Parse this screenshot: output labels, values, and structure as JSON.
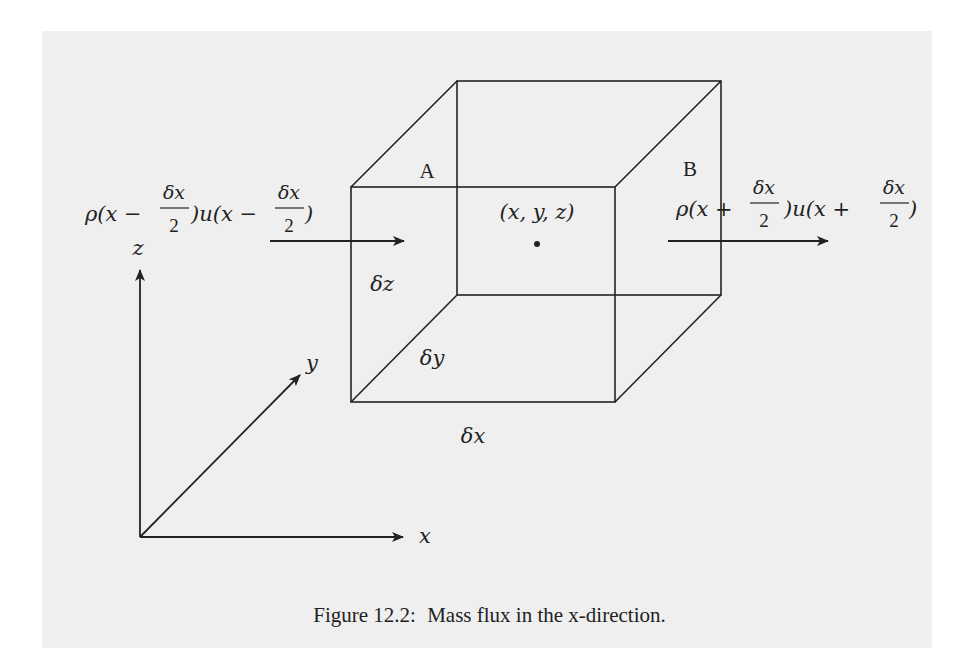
{
  "figure": {
    "caption_prefix": "Figure 12.2:",
    "caption_text": "Mass flux in the x-direction."
  },
  "labels": {
    "face_a": "A",
    "face_b": "B",
    "center_point": "(x, y, z)",
    "delta_x": "δx",
    "delta_y": "δy",
    "delta_z": "δz",
    "axis_x": "x",
    "axis_y": "y",
    "axis_z": "z"
  },
  "inflow": {
    "rho_part": "ρ(x −",
    "frac_num": "δx",
    "frac_den": "2",
    "u_part": ")u(x −",
    "frac2_num": "δx",
    "frac2_den": "2",
    "close": ")"
  },
  "outflow": {
    "rho_part": "ρ(x +",
    "frac_num": "δx",
    "frac_den": "2",
    "u_part": ")u(x +",
    "frac2_num": "δx",
    "frac2_den": "2",
    "close": ")"
  },
  "colors": {
    "background": "#ffffff",
    "panel": "#efefef",
    "ink": "#222222"
  }
}
